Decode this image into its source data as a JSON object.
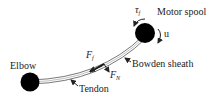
{
  "diagram": {
    "labels": {
      "motor_spool": "Motor spool",
      "elbow": "Elbow",
      "bowden_sheath": "Bowden sheath",
      "tendon": "Tendon",
      "tau_symbol": "τ",
      "tau_sub": "f",
      "u": "u",
      "ff_symbol": "F",
      "ff_sub": "f",
      "fn_symbol": "F",
      "fn_sub": "N"
    },
    "colors": {
      "node_fill": "#000000",
      "line": "#333333",
      "text": "#222222"
    }
  }
}
